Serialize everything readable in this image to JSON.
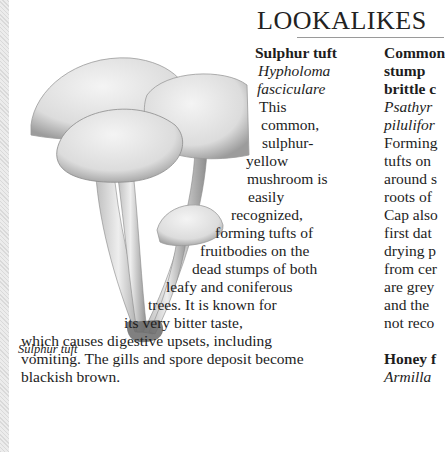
{
  "heading": "LOOKALIKES",
  "illustration": {
    "caption": "Sulphur tuft",
    "icon": "mushroom-illustration"
  },
  "entries": [
    {
      "common_name": "Sulphur tuft",
      "latin_name": [
        "Hypholoma",
        "fasciculare"
      ],
      "body_lines": [
        "This",
        "common,",
        "sulphur-",
        "yellow",
        "mushroom is",
        "easily",
        "recognized,",
        "forming tufts of",
        "fruitbodies on the",
        "dead stumps of both",
        "leafy and coniferous",
        "trees. It is known for",
        "its very bitter taste,",
        "which causes digestive upsets, including",
        "vomiting. The gills and spore deposit become",
        "blackish brown."
      ]
    },
    {
      "common_name_lines": [
        "Common",
        "stump",
        "brittle c"
      ],
      "latin_name": [
        "Psathyr",
        "pilulifor"
      ],
      "body_lines": [
        "Forming",
        "tufts on",
        "around s",
        "roots of",
        "Cap also",
        "first dat",
        "drying p",
        "from cer",
        "are grey",
        "and the",
        "not reco"
      ]
    },
    {
      "common_name": "Honey f",
      "latin_name": [
        "Armilla"
      ]
    }
  ]
}
